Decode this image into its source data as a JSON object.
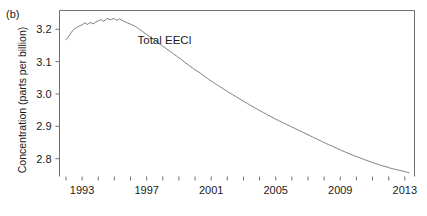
{
  "figure": {
    "panel_label": "(b)",
    "background_color": "#ffffff",
    "frame_color": "#6f6f6f",
    "line_color": "#7a7a7a",
    "text_color": "#1a1a1a"
  },
  "chart_data": {
    "type": "line",
    "title": "",
    "subtitle": "",
    "panel": "(b)",
    "xlabel": "",
    "ylabel": "Concentration (parts per billion)",
    "legend_position": "inline-annotation",
    "grid": false,
    "annotations": [
      {
        "text": "Total EECl",
        "x": 1998.1,
        "y": 3.155
      }
    ],
    "series": [
      {
        "name": "Total EECl",
        "x": [
          1992.0,
          1992.0833,
          1992.1667,
          1992.25,
          1992.3333,
          1992.4167,
          1992.5,
          1992.5833,
          1992.6667,
          1992.75,
          1992.8333,
          1992.9167,
          1993.0,
          1993.0833,
          1993.1667,
          1993.25,
          1993.3333,
          1993.4167,
          1993.5,
          1993.5833,
          1993.6667,
          1993.75,
          1993.8333,
          1993.9167,
          1994.0,
          1994.0833,
          1994.1667,
          1994.25,
          1994.3333,
          1994.4167,
          1994.5,
          1994.5833,
          1994.6667,
          1994.75,
          1994.8333,
          1994.9167,
          1995.0,
          1995.0833,
          1995.1667,
          1995.25,
          1995.3333,
          1995.4167,
          1995.5,
          1995.5833,
          1995.6667,
          1995.75,
          1995.8333,
          1995.9167,
          1996.0,
          1996.0833,
          1996.1667,
          1996.25,
          1996.3333,
          1996.4167,
          1996.5,
          1996.5833,
          1996.6667,
          1996.75,
          1996.8333,
          1996.9167,
          1997.0,
          1997.0833,
          1997.1667,
          1997.25,
          1997.3333,
          1997.4167,
          1997.5,
          1997.5833,
          1997.6667,
          1997.75,
          1997.8333,
          1997.9167,
          1998.0,
          1998.0833,
          1998.1667,
          1998.25,
          1998.3333,
          1998.4167,
          1998.5,
          1998.5833,
          1998.6667,
          1998.75,
          1998.8333,
          1998.9167,
          1999.0,
          1999.0833,
          1999.1667,
          1999.25,
          1999.3333,
          1999.4167,
          1999.5,
          1999.5833,
          1999.6667,
          1999.75,
          1999.8333,
          1999.9167,
          2000.0,
          2000.0833,
          2000.1667,
          2000.25,
          2000.3333,
          2000.4167,
          2000.5,
          2000.5833,
          2000.6667,
          2000.75,
          2000.8333,
          2000.9167,
          2001.0,
          2001.0833,
          2001.1667,
          2001.25,
          2001.3333,
          2001.4167,
          2001.5,
          2001.5833,
          2001.6667,
          2001.75,
          2001.8333,
          2001.9167,
          2002.0,
          2002.0833,
          2002.1667,
          2002.25,
          2002.3333,
          2002.4167,
          2002.5,
          2002.5833,
          2002.6667,
          2002.75,
          2002.8333,
          2002.9167,
          2003.0,
          2003.0833,
          2003.1667,
          2003.25,
          2003.3333,
          2003.4167,
          2003.5,
          2003.5833,
          2003.6667,
          2003.75,
          2003.8333,
          2003.9167,
          2004.0,
          2004.0833,
          2004.1667,
          2004.25,
          2004.3333,
          2004.4167,
          2004.5,
          2004.5833,
          2004.6667,
          2004.75,
          2004.8333,
          2004.9167,
          2005.0,
          2005.0833,
          2005.1667,
          2005.25,
          2005.3333,
          2005.4167,
          2005.5,
          2005.5833,
          2005.6667,
          2005.75,
          2005.8333,
          2005.9167,
          2006.0,
          2006.0833,
          2006.1667,
          2006.25,
          2006.3333,
          2006.4167,
          2006.5,
          2006.5833,
          2006.6667,
          2006.75,
          2006.8333,
          2006.9167,
          2007.0,
          2007.0833,
          2007.1667,
          2007.25,
          2007.3333,
          2007.4167,
          2007.5,
          2007.5833,
          2007.6667,
          2007.75,
          2007.8333,
          2007.9167,
          2008.0,
          2008.0833,
          2008.1667,
          2008.25,
          2008.3333,
          2008.4167,
          2008.5,
          2008.5833,
          2008.6667,
          2008.75,
          2008.8333,
          2008.9167,
          2009.0,
          2009.0833,
          2009.1667,
          2009.25,
          2009.3333,
          2009.4167,
          2009.5,
          2009.5833,
          2009.6667,
          2009.75,
          2009.8333,
          2009.9167,
          2010.0,
          2010.0833,
          2010.1667,
          2010.25,
          2010.3333,
          2010.4167,
          2010.5,
          2010.5833,
          2010.6667,
          2010.75,
          2010.8333,
          2010.9167,
          2011.0,
          2011.0833,
          2011.1667,
          2011.25,
          2011.3333,
          2011.4167,
          2011.5,
          2011.5833,
          2011.6667,
          2011.75,
          2011.8333,
          2011.9167,
          2012.0,
          2012.0833,
          2012.1667,
          2012.25,
          2012.3333,
          2012.4167,
          2012.5,
          2012.5833,
          2012.6667,
          2012.75,
          2012.8333,
          2012.9167,
          2013.0,
          2013.0833,
          2013.1667,
          2013.25
        ],
        "values": [
          3.168,
          3.172,
          3.178,
          3.184,
          3.19,
          3.196,
          3.2,
          3.203,
          3.205,
          3.208,
          3.21,
          3.212,
          3.214,
          3.217,
          3.22,
          3.217,
          3.215,
          3.218,
          3.221,
          3.219,
          3.217,
          3.219,
          3.222,
          3.224,
          3.226,
          3.228,
          3.23,
          3.227,
          3.225,
          3.228,
          3.231,
          3.233,
          3.231,
          3.229,
          3.231,
          3.233,
          3.232,
          3.23,
          3.228,
          3.23,
          3.232,
          3.229,
          3.227,
          3.225,
          3.223,
          3.221,
          3.219,
          3.217,
          3.216,
          3.214,
          3.212,
          3.21,
          3.208,
          3.205,
          3.202,
          3.199,
          3.196,
          3.193,
          3.19,
          3.187,
          3.184,
          3.181,
          3.178,
          3.175,
          3.172,
          3.169,
          3.166,
          3.163,
          3.16,
          3.157,
          3.154,
          3.151,
          3.148,
          3.145,
          3.142,
          3.139,
          3.136,
          3.133,
          3.13,
          3.127,
          3.124,
          3.121,
          3.118,
          3.115,
          3.112,
          3.109,
          3.106,
          3.103,
          3.099,
          3.096,
          3.093,
          3.09,
          3.087,
          3.084,
          3.081,
          3.078,
          3.075,
          3.072,
          3.07,
          3.067,
          3.064,
          3.061,
          3.058,
          3.055,
          3.052,
          3.049,
          3.046,
          3.043,
          3.04,
          3.038,
          3.035,
          3.032,
          3.029,
          3.027,
          3.024,
          3.021,
          3.019,
          3.016,
          3.013,
          3.011,
          3.008,
          3.005,
          3.003,
          3.0,
          2.998,
          2.995,
          2.993,
          2.99,
          2.988,
          2.985,
          2.983,
          2.98,
          2.978,
          2.975,
          2.973,
          2.97,
          2.968,
          2.965,
          2.963,
          2.961,
          2.958,
          2.956,
          2.954,
          2.951,
          2.949,
          2.947,
          2.944,
          2.942,
          2.94,
          2.938,
          2.935,
          2.933,
          2.931,
          2.929,
          2.927,
          2.924,
          2.922,
          2.92,
          2.918,
          2.916,
          2.914,
          2.912,
          2.91,
          2.908,
          2.906,
          2.904,
          2.902,
          2.9,
          2.898,
          2.896,
          2.894,
          2.892,
          2.89,
          2.888,
          2.886,
          2.884,
          2.882,
          2.88,
          2.878,
          2.876,
          2.874,
          2.872,
          2.87,
          2.868,
          2.866,
          2.864,
          2.862,
          2.86,
          2.858,
          2.856,
          2.854,
          2.852,
          2.85,
          2.848,
          2.846,
          2.844,
          2.842,
          2.841,
          2.839,
          2.837,
          2.835,
          2.833,
          2.831,
          2.829,
          2.827,
          2.825,
          2.824,
          2.822,
          2.82,
          2.818,
          2.817,
          2.815,
          2.813,
          2.812,
          2.81,
          2.808,
          2.807,
          2.805,
          2.804,
          2.802,
          2.8,
          2.799,
          2.797,
          2.796,
          2.794,
          2.793,
          2.791,
          2.79,
          2.788,
          2.787,
          2.785,
          2.784,
          2.783,
          2.781,
          2.78,
          2.779,
          2.777,
          2.776,
          2.775,
          2.774,
          2.773,
          2.771,
          2.77,
          2.769,
          2.768,
          2.767,
          2.766,
          2.765,
          2.764,
          2.763,
          2.762,
          2.761,
          2.76,
          2.759,
          2.758,
          2.757
        ]
      }
    ],
    "xlim": [
      1991.6,
      2013.6
    ],
    "ylim": [
      2.745,
      3.258
    ],
    "x_ticks_major": [
      1993,
      1997,
      2001,
      2005,
      2009,
      2013
    ],
    "x_tick_labels": [
      "1993",
      "1997",
      "2001",
      "2005",
      "2009",
      "2013"
    ],
    "x_ticks_minor": [
      1992,
      1993,
      1994,
      1995,
      1996,
      1997,
      1998,
      1999,
      2000,
      2001,
      2002,
      2003,
      2004,
      2005,
      2006,
      2007,
      2008,
      2009,
      2010,
      2011,
      2012,
      2013
    ],
    "y_ticks": [
      2.8,
      2.9,
      3.0,
      3.1,
      3.2
    ],
    "y_tick_labels": [
      "2.8",
      "2.9",
      "3.0",
      "3.1",
      "3.2"
    ]
  }
}
